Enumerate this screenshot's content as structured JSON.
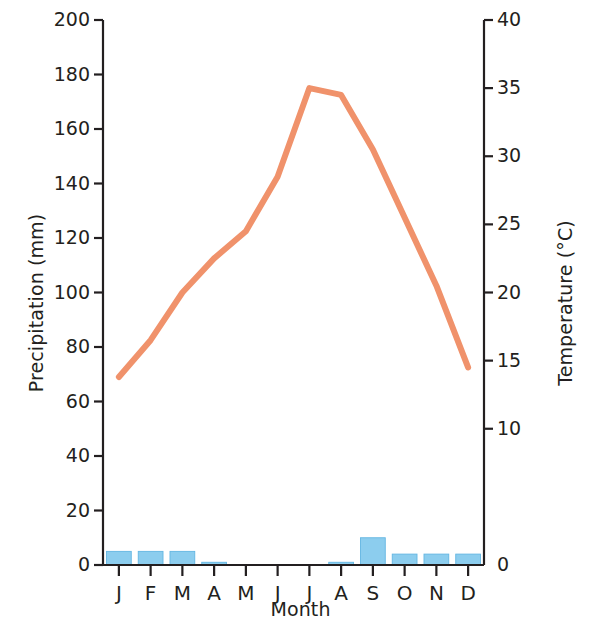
{
  "chart_data": {
    "type": "line",
    "title": "",
    "xlabel": "Month",
    "categories": [
      "J",
      "F",
      "M",
      "A",
      "M",
      "J",
      "J",
      "A",
      "S",
      "O",
      "N",
      "D"
    ],
    "month_names": [
      "January",
      "February",
      "March",
      "April",
      "May",
      "June",
      "July",
      "August",
      "September",
      "October",
      "November",
      "December"
    ],
    "grid": false,
    "legend_position": "none",
    "axes": {
      "left": {
        "label": "Precipitation (mm)",
        "unit": "mm",
        "ylim": [
          0,
          200
        ],
        "tick_step": 20,
        "ticks": [
          0,
          20,
          40,
          60,
          80,
          100,
          120,
          140,
          160,
          180,
          200
        ],
        "tick_labels": [
          "0",
          "20",
          "40",
          "60",
          "80",
          "100",
          "120",
          "140",
          "160",
          "180",
          "200"
        ]
      },
      "right": {
        "label": "Temperature (°C)",
        "unit": "°C",
        "ylim": [
          0,
          40
        ],
        "tick_step": 5,
        "ticks": [
          0,
          10,
          15,
          20,
          25,
          30,
          35,
          40
        ],
        "tick_labels": [
          "0",
          "10",
          "15",
          "20",
          "25",
          "30",
          "35",
          "40"
        ]
      }
    },
    "series": [
      {
        "name": "Precipitation",
        "type": "bar",
        "axis": "left",
        "color": "#8ccdee",
        "edge_color": "#63b6e2",
        "unit": "mm",
        "values": [
          5,
          5,
          5,
          1,
          0,
          0,
          0,
          1,
          10,
          4,
          4,
          4
        ]
      },
      {
        "name": "Temperature",
        "type": "line",
        "axis": "right",
        "color": "#f0926b",
        "line_width": 6,
        "unit": "°C",
        "values": [
          13.8,
          16.5,
          20.0,
          22.5,
          24.5,
          28.5,
          35.0,
          34.5,
          30.5,
          25.5,
          20.5,
          14.5
        ]
      }
    ]
  }
}
